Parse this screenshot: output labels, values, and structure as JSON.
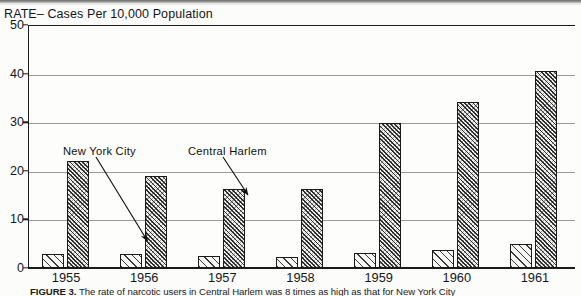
{
  "axis_title": "RATE– Cases Per 10,000 Population",
  "caption": {
    "figure_label": "FIGURE 3.",
    "text": "The rate of narcotic users in Central Harlem was 8 times as high as that for  New York City"
  },
  "annotations": [
    {
      "name": "new-york-city",
      "label": "New York City"
    },
    {
      "name": "central-harlem",
      "label": "Central Harlem"
    }
  ],
  "colors": {
    "axis": "#1b1b1b",
    "grid": "#9a9a9a",
    "background": "#fdfdfb",
    "hatch": "#2e2e2e"
  },
  "chart_data": {
    "type": "bar",
    "title": "",
    "xlabel": "",
    "ylabel": "RATE– Cases Per 10,000 Population",
    "ylim": [
      0,
      50
    ],
    "yticks": [
      0,
      10,
      20,
      30,
      40,
      50
    ],
    "grid": true,
    "legend": "annotated-arrows",
    "categories": [
      "1955",
      "1956",
      "1957",
      "1958",
      "1959",
      "1960",
      "1961"
    ],
    "series": [
      {
        "name": "New York City",
        "values": [
          2.8,
          2.9,
          2.4,
          2.3,
          3.0,
          3.7,
          5.0
        ]
      },
      {
        "name": "Central Harlem",
        "values": [
          22.0,
          19.0,
          16.3,
          16.3,
          29.8,
          34.2,
          40.5
        ]
      }
    ]
  }
}
